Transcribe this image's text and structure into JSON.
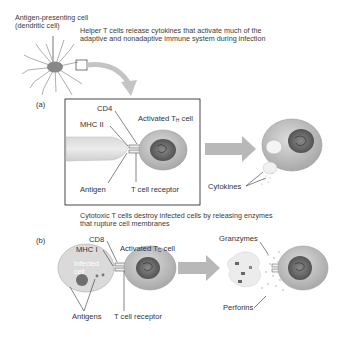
{
  "figure": {
    "apc_label_line1": "Antigen-presenting cell",
    "apc_label_line2": "(dendritic cell)",
    "panel_a": {
      "letter": "(a)",
      "caption_line1": "Helper T cells release cytokines that activate much of the",
      "caption_line2": "adaptive and nonadaptive immune system during infection",
      "labels": {
        "cd4": "CD4",
        "mhc": "MHC II",
        "antigen": "Antigen",
        "tcr": "T cell receptor",
        "activated_cell_prefix": "Activated T",
        "activated_cell_sub": "H",
        "activated_cell_suffix": " cell",
        "cytokines": "Cytokines"
      }
    },
    "panel_b": {
      "letter": "(b)",
      "caption_line1": "Cytotoxic T cells destroy infected cells by releasing enzymes",
      "caption_line2": "that rupture cell membranes",
      "labels": {
        "cd8": "CD8",
        "mhc": "MHC I",
        "infected_line1": "Infected",
        "infected_line2": "cell",
        "antigens": "Antigens",
        "tcr": "T cell receptor",
        "activated_cell_prefix": "Activated T",
        "activated_cell_sub": "C",
        "activated_cell_suffix": " cell",
        "granzymes": "Granzymes",
        "perforins": "Perforins"
      }
    },
    "colors": {
      "cell_fill": "#c9c9c9",
      "nucleus": "#6a6a6a",
      "arrow": "#b5b5b5",
      "apc_fill": "#d6d6d6",
      "text": "#333333"
    }
  }
}
